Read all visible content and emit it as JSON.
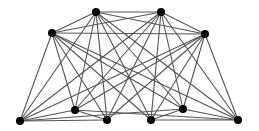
{
  "diagram": {
    "type": "graph",
    "edge_color": "#555555",
    "node_color": "#000000",
    "node_radius": 4,
    "nodes": [
      {
        "id": "A",
        "x": 96,
        "y": 12
      },
      {
        "id": "B",
        "x": 161,
        "y": 12
      },
      {
        "id": "C",
        "x": 52,
        "y": 33
      },
      {
        "id": "D",
        "x": 205,
        "y": 34
      },
      {
        "id": "E",
        "x": 20,
        "y": 121
      },
      {
        "id": "F",
        "x": 75,
        "y": 110
      },
      {
        "id": "G",
        "x": 107,
        "y": 120
      },
      {
        "id": "H",
        "x": 151,
        "y": 120
      },
      {
        "id": "I",
        "x": 183,
        "y": 109
      },
      {
        "id": "J",
        "x": 238,
        "y": 120
      }
    ],
    "edges": [
      [
        "A",
        "B"
      ],
      [
        "A",
        "C"
      ],
      [
        "A",
        "D"
      ],
      [
        "B",
        "C"
      ],
      [
        "B",
        "D"
      ],
      [
        "C",
        "D"
      ],
      [
        "A",
        "E"
      ],
      [
        "A",
        "F"
      ],
      [
        "A",
        "G"
      ],
      [
        "A",
        "H"
      ],
      [
        "A",
        "I"
      ],
      [
        "A",
        "J"
      ],
      [
        "B",
        "E"
      ],
      [
        "B",
        "F"
      ],
      [
        "B",
        "G"
      ],
      [
        "B",
        "H"
      ],
      [
        "B",
        "I"
      ],
      [
        "B",
        "J"
      ],
      [
        "C",
        "E"
      ],
      [
        "C",
        "F"
      ],
      [
        "C",
        "G"
      ],
      [
        "C",
        "H"
      ],
      [
        "C",
        "I"
      ],
      [
        "C",
        "J"
      ],
      [
        "D",
        "E"
      ],
      [
        "D",
        "F"
      ],
      [
        "D",
        "G"
      ],
      [
        "D",
        "H"
      ],
      [
        "D",
        "I"
      ],
      [
        "D",
        "J"
      ],
      [
        "E",
        "F"
      ],
      [
        "E",
        "G"
      ],
      [
        "F",
        "G"
      ],
      [
        "H",
        "I"
      ],
      [
        "H",
        "J"
      ],
      [
        "I",
        "J"
      ],
      [
        "E",
        "I"
      ],
      [
        "F",
        "J"
      ]
    ]
  }
}
